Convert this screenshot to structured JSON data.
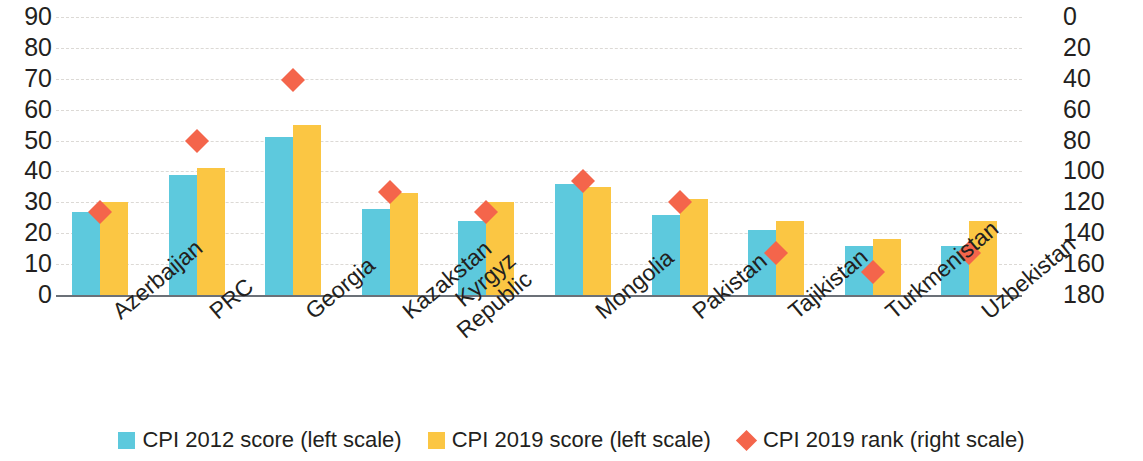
{
  "chart_data": {
    "type": "bar",
    "title": "",
    "subtitle": "",
    "xlabel": "",
    "ylabel": "",
    "y2label": "",
    "grid": true,
    "legend_position": "bottom",
    "categories": [
      "Azerbaijan",
      "PRC",
      "Georgia",
      "Kazakstan",
      "Kyrgyz\nRepublic",
      "Mongolia",
      "Pakistan",
      "Tajikistan",
      "Turkmenistan",
      "Uzbekistan"
    ],
    "ylim": [
      0,
      90
    ],
    "yticks": [
      0,
      10,
      20,
      30,
      40,
      50,
      60,
      70,
      80,
      90
    ],
    "y2lim": [
      180,
      0
    ],
    "y2ticks": [
      0,
      20,
      40,
      60,
      80,
      100,
      120,
      140,
      160,
      180
    ],
    "y2_inverted": true,
    "series": [
      {
        "name": "CPI 2012 score (left scale)",
        "type": "bar",
        "axis": "left",
        "color": "#5dc9dd",
        "values": [
          27,
          39,
          51,
          28,
          24,
          36,
          26,
          21,
          16,
          16
        ]
      },
      {
        "name": "CPI 2019 score (left scale)",
        "type": "bar",
        "axis": "left",
        "color": "#fbc643",
        "values": [
          30,
          41,
          55,
          33,
          30,
          35,
          31,
          24,
          18,
          24
        ]
      },
      {
        "name": "CPI 2019 rank (right scale)",
        "type": "scatter",
        "marker": "diamond",
        "axis": "right",
        "color": "#f4654b",
        "values": [
          126,
          80,
          41,
          113,
          126,
          106,
          120,
          153,
          165,
          153
        ]
      }
    ]
  },
  "axes": {
    "left_ticks": [
      "90",
      "80",
      "70",
      "60",
      "50",
      "40",
      "30",
      "20",
      "10",
      "0"
    ],
    "right_ticks": [
      "0",
      "20",
      "40",
      "60",
      "80",
      "100",
      "120",
      "140",
      "160",
      "180"
    ]
  },
  "legend": {
    "items": [
      {
        "label": "CPI 2012 score (left scale)",
        "marker": "square",
        "color": "#5dc9dd"
      },
      {
        "label": "CPI 2019 score (left scale)",
        "marker": "square",
        "color": "#fbc643"
      },
      {
        "label": "CPI 2019 rank (right scale)",
        "marker": "diamond",
        "color": "#f4654b"
      }
    ]
  },
  "colors": {
    "series_2012": "#5dc9dd",
    "series_2019": "#fbc643",
    "rank_marker": "#f4654b",
    "gridline": "#d6d3ce",
    "axis_line": "#6b7077",
    "text": "#231f20"
  }
}
